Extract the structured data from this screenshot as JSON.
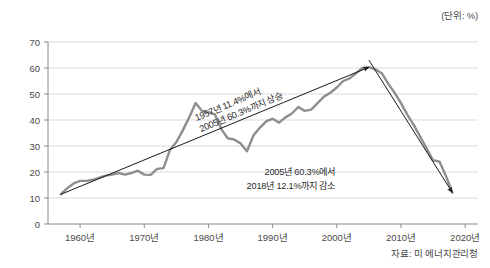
{
  "figure": {
    "unit_label": "(단위: %)",
    "source_label": "자료: 미 에너지관리청"
  },
  "colors": {
    "series_line": "#8e8e8e",
    "arrow": "#1a1a1a",
    "grid": "#d9d9d9",
    "axis": "#8a8a8a",
    "text": "#4a4a4a"
  },
  "annotations": {
    "rising_line1": "1957년 11.4%에서",
    "rising_line2": "2005년 60.3%까지 상승",
    "falling_line1": "2005년 60.3%에서",
    "falling_line2": "2018년 12.1%까지 감소"
  },
  "chart_data": {
    "type": "line",
    "title": "",
    "xlabel": "",
    "ylabel": "",
    "unit": "%",
    "grid": true,
    "legend": "none",
    "xlim": [
      1955,
      2022
    ],
    "ylim": [
      0,
      70
    ],
    "yticks": [
      0,
      10,
      20,
      30,
      40,
      50,
      60,
      70
    ],
    "xticks": [
      1960,
      1970,
      1980,
      1990,
      2000,
      2010,
      2020
    ],
    "xtick_labels": [
      "1960년",
      "1970년",
      "1980년",
      "1990년",
      "2000년",
      "2010년",
      "2020년"
    ],
    "ytick_labels": [
      "0",
      "10",
      "20",
      "30",
      "40",
      "50",
      "60",
      "70"
    ],
    "series": [
      {
        "name": "비중",
        "x": [
          1957,
          1958,
          1959,
          1960,
          1961,
          1962,
          1963,
          1964,
          1965,
          1966,
          1967,
          1968,
          1969,
          1970,
          1971,
          1972,
          1973,
          1974,
          1975,
          1976,
          1977,
          1978,
          1979,
          1980,
          1981,
          1982,
          1983,
          1984,
          1985,
          1986,
          1987,
          1988,
          1989,
          1990,
          1991,
          1992,
          1993,
          1994,
          1995,
          1996,
          1997,
          1998,
          1999,
          2000,
          2001,
          2002,
          2003,
          2004,
          2005,
          2006,
          2007,
          2008,
          2009,
          2010,
          2011,
          2012,
          2013,
          2014,
          2015,
          2016,
          2017,
          2018
        ],
        "values": [
          11.4,
          13.8,
          15.6,
          16.6,
          16.6,
          17.0,
          17.8,
          18.6,
          19.0,
          19.6,
          19.0,
          19.6,
          20.5,
          19.0,
          18.9,
          21.2,
          21.5,
          28.5,
          31.5,
          36.0,
          41.0,
          46.5,
          43.5,
          43.0,
          42.2,
          36.5,
          33.0,
          32.5,
          31.0,
          28.0,
          34.0,
          37.0,
          39.5,
          40.5,
          39.0,
          41.0,
          42.5,
          45.0,
          43.5,
          44.0,
          46.5,
          49.0,
          50.5,
          52.5,
          55.0,
          56.0,
          58.0,
          60.0,
          60.3,
          59.5,
          58.0,
          54.0,
          50.5,
          46.5,
          42.0,
          38.0,
          33.5,
          29.0,
          24.5,
          24.0,
          18.5,
          12.1
        ]
      }
    ],
    "arrows": [
      {
        "name": "rising-trend-arrow",
        "from": [
          1957,
          11.4
        ],
        "to": [
          2005,
          60.3
        ],
        "label": "1957년 11.4%에서 2005년 60.3%까지 상승"
      },
      {
        "name": "falling-trend-arrow",
        "from": [
          2005,
          63.0
        ],
        "to": [
          2018,
          12.1
        ],
        "label": "2005년 60.3%에서 2018년 12.1%까지 감소"
      }
    ]
  }
}
